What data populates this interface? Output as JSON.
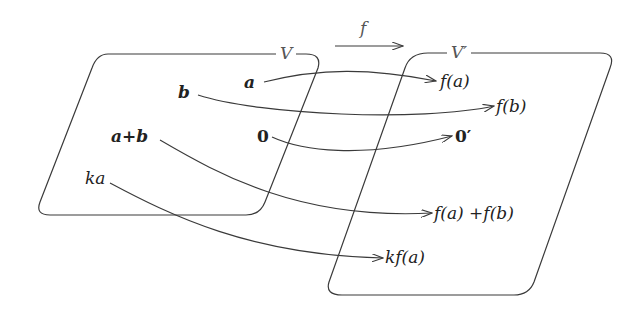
{
  "diagram": {
    "map_label": "f",
    "domain_space": {
      "label": "V"
    },
    "codomain_space": {
      "label": "V′"
    },
    "domain_elements": {
      "a": "a",
      "b": "b",
      "a_plus_b": "a+b",
      "zero": "0",
      "ka": "ka"
    },
    "codomain_elements": {
      "f_a": "f(a)",
      "f_b": "f(b)",
      "zero_prime": "0′",
      "f_a_plus_f_b": "f(a) +f(b)",
      "kf_a": "kf(a)"
    },
    "mappings": [
      {
        "from": "a",
        "to": "f(a)"
      },
      {
        "from": "b",
        "to": "f(b)"
      },
      {
        "from": "0",
        "to": "0′"
      },
      {
        "from": "a+b",
        "to": "f(a) +f(b)"
      },
      {
        "from": "ka",
        "to": "kf(a)"
      }
    ],
    "colors": {
      "stroke": "#3a3a3a",
      "text": "#222222",
      "muted": "#555555"
    }
  }
}
